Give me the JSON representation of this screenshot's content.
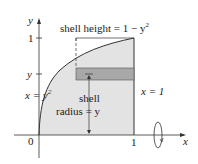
{
  "diagram": {
    "axes": {
      "x_label": "x",
      "y_label": "y",
      "origin_label": "0",
      "x_tick_label": "1",
      "y_tick_1_label": "1",
      "y_tick_y_label": "y"
    },
    "curve_label_pre": "x = y",
    "curve_label_exp": "2",
    "line_label": "x = 1",
    "shell_height_pre": "shell height = 1 − y",
    "shell_height_exp": "2",
    "shell_radius_line1": "shell",
    "shell_radius_line2": "radius = y",
    "colors": {
      "region_fill": "#e3e3e3",
      "shell_fill": "#a8a8a8",
      "line": "#333333"
    }
  }
}
